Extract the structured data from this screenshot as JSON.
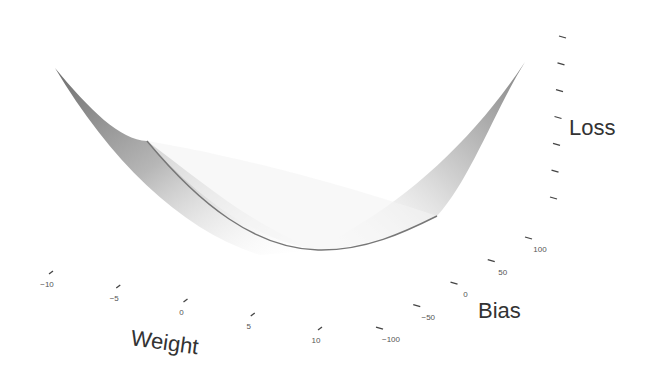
{
  "chart_data": {
    "type": "surface3d",
    "title": "",
    "axes": {
      "x": {
        "label": "Weight",
        "ticks": [
          -10,
          -5,
          0,
          5,
          10
        ],
        "tick_labels": [
          "−10",
          "−5",
          "0",
          "5",
          "10"
        ],
        "range": [
          -10,
          10
        ]
      },
      "y": {
        "label": "Bias",
        "ticks": [
          -100,
          -50,
          0,
          50,
          100
        ],
        "tick_labels": [
          "−100",
          "−50",
          "0",
          "50",
          "100"
        ],
        "range": [
          -100,
          100
        ]
      },
      "z": {
        "label": "Loss",
        "tick_count": 7,
        "tick_labels": []
      }
    },
    "surface": {
      "shape": "parabolic valley (loss = quadratic in weight)",
      "colormap": "grayscale",
      "min_at_weight": 0
    },
    "curve": {
      "name": "loss-vs-weight",
      "weight": [
        -6,
        -3,
        0,
        3,
        6
      ],
      "relative_loss": [
        0.36,
        0.09,
        0,
        0.09,
        0.36
      ]
    },
    "grid": false,
    "legend": "none"
  }
}
